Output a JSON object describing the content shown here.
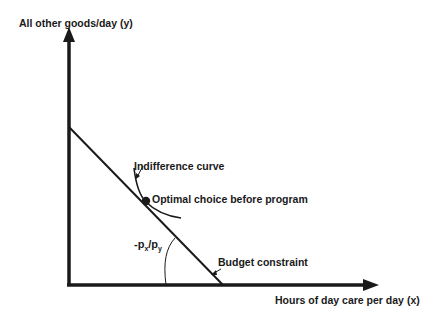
{
  "diagram": {
    "y_axis_label": "All other goods/day (y)",
    "x_axis_label": "Hours of day care per day (x)",
    "indifference_label": "Indifference curve",
    "optimal_label": "Optimal choice before program",
    "budget_label": "Budget constraint",
    "slope_label": {
      "prefix": "-p",
      "sub1": "x",
      "slash": "/p",
      "sub2": "y"
    },
    "colors": {
      "ink": "#1a1a1a",
      "background": "#ffffff"
    }
  }
}
